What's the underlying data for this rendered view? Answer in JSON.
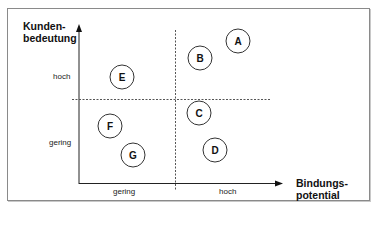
{
  "diagram": {
    "y_axis_title_line1": "Kunden-",
    "y_axis_title_line2": "bedeutung",
    "x_axis_title_line1": "Bindungs-",
    "x_axis_title_line2": "potential",
    "y_ticks": {
      "high": "hoch",
      "low": "gering"
    },
    "x_ticks": {
      "low": "gering",
      "high": "hoch"
    },
    "points": [
      {
        "label": "A",
        "quadrant": "high-high"
      },
      {
        "label": "B",
        "quadrant": "high-high"
      },
      {
        "label": "C",
        "quadrant": "high-potential-low-importance"
      },
      {
        "label": "D",
        "quadrant": "high-potential-low-importance"
      },
      {
        "label": "E",
        "quadrant": "low-potential-high-importance"
      },
      {
        "label": "F",
        "quadrant": "low-low"
      },
      {
        "label": "G",
        "quadrant": "low-low"
      }
    ],
    "colors": {
      "line": "#222222",
      "dashed": "#555555",
      "border": "#8a8a8a"
    }
  }
}
